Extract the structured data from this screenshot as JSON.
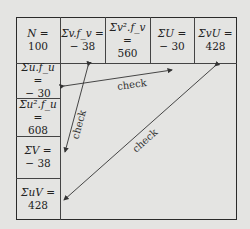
{
  "header_row": [
    {
      "label": "N =",
      "value": "100"
    },
    {
      "label": "Σv.f_v =",
      "value": "− 38"
    },
    {
      "label": "Σv².f_v =",
      "value": "560"
    },
    {
      "label": "ΣU =",
      "value": "− 30"
    },
    {
      "label": "ΣvU =",
      "value": "428"
    }
  ],
  "left_column": [
    {
      "label": "Σu.f_u =",
      "value": "− 30"
    },
    {
      "label": "Σu².f_u =",
      "value": "608"
    },
    {
      "label": "ΣV =",
      "value": "− 38"
    },
    {
      "label": "ΣuV =",
      "value": "428"
    }
  ],
  "check_labels": [
    "check",
    "check",
    "check"
  ],
  "colors": {
    "background": "#e4e4e2",
    "line": "#2a2a2a",
    "text": "#222222"
  }
}
